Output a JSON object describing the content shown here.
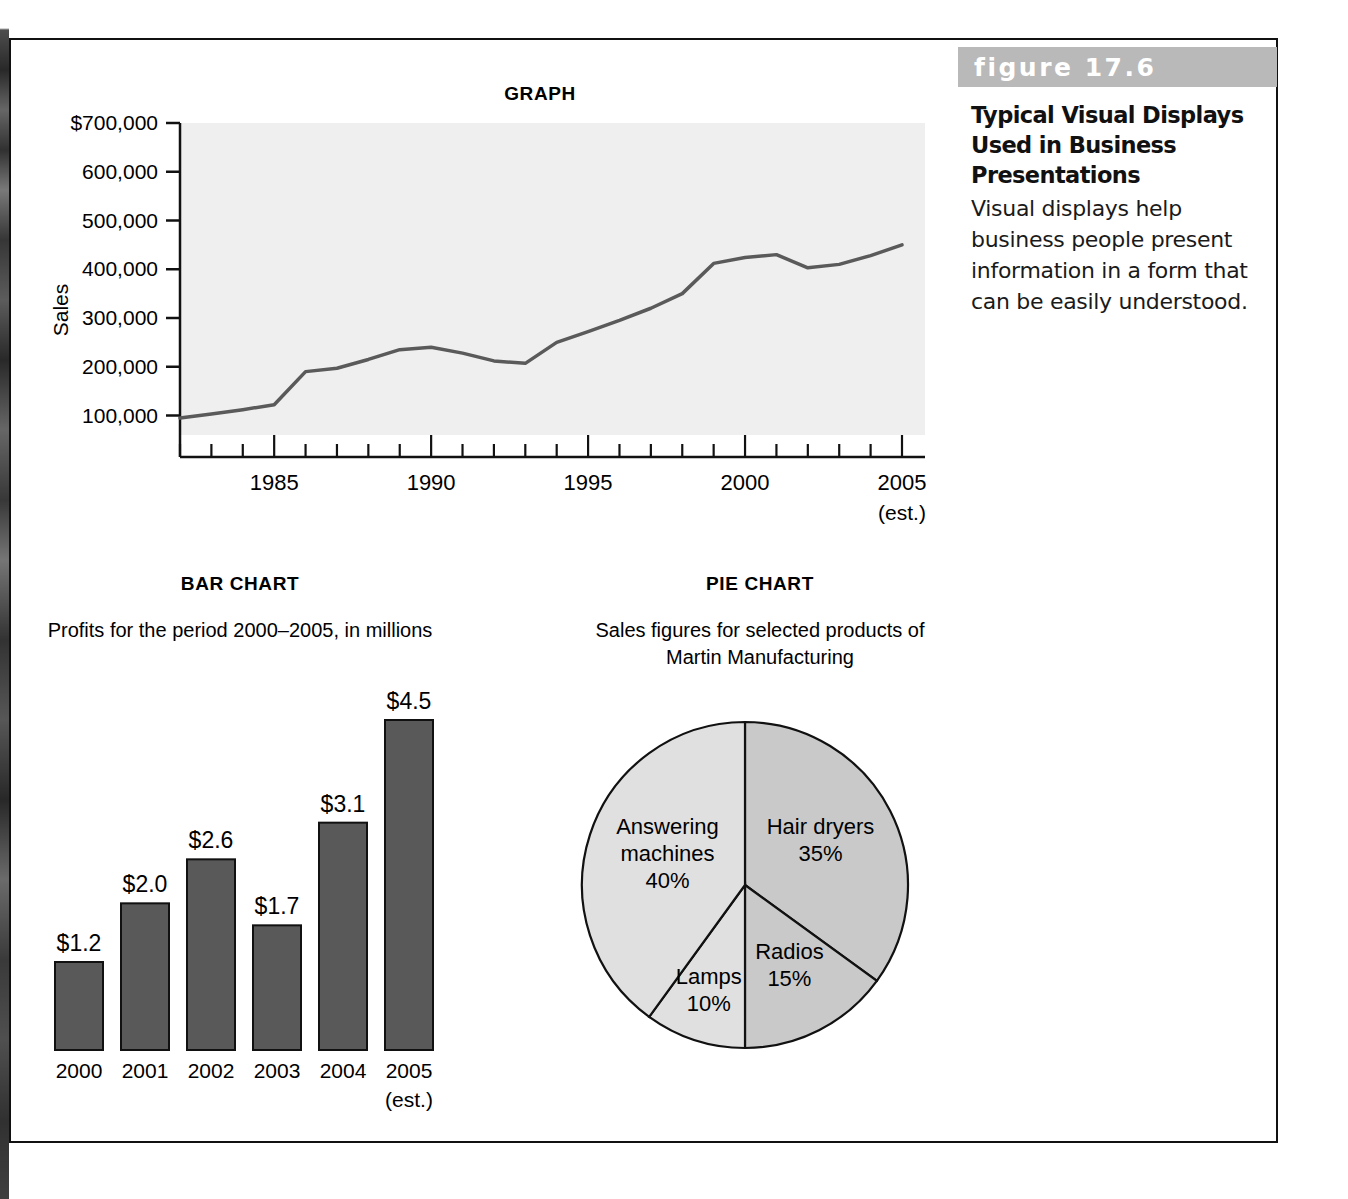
{
  "figure": {
    "number_label": "figure 17.6",
    "title": "Typical Visual Displays Used in Business Presentations",
    "description": "Visual displays help business people present information in a form that can be easily understood.",
    "header_bg": "#b9b9b9"
  },
  "colors": {
    "plot_background": "#efefef",
    "line_color": "#5a5a5a",
    "bar_fill": "#595959",
    "bar_stroke": "#111111",
    "pie_light": "#e0e0e0",
    "pie_dark": "#c9c9c9",
    "axis": "#111111"
  },
  "chart_data": [
    {
      "type": "line",
      "title": "GRAPH",
      "xlabel": "",
      "ylabel": "Sales",
      "ylim": [
        60000,
        700000
      ],
      "xlim": [
        1982,
        2005
      ],
      "grid": false,
      "y_ticks": [
        "$700,000",
        "600,000",
        "500,000",
        "400,000",
        "300,000",
        "200,000",
        "100,000"
      ],
      "y_tick_values": [
        700000,
        600000,
        500000,
        400000,
        300000,
        200000,
        100000
      ],
      "x_ticks": [
        "1985",
        "1990",
        "1995",
        "2000",
        "2005"
      ],
      "x_tick_values": [
        1985,
        1990,
        1995,
        2000,
        2005
      ],
      "x_tick_note": "(est.)",
      "x": [
        1982,
        1983,
        1984,
        1985,
        1986,
        1987,
        1988,
        1989,
        1990,
        1991,
        1992,
        1993,
        1994,
        1995,
        1996,
        1997,
        1998,
        1999,
        2000,
        2001,
        2002,
        2003,
        2004,
        2005
      ],
      "values": [
        95000,
        103000,
        112000,
        122000,
        190000,
        197000,
        215000,
        235000,
        240000,
        228000,
        212000,
        207000,
        250000,
        272000,
        295000,
        320000,
        350000,
        412000,
        424000,
        430000,
        403000,
        410000,
        428000,
        450000
      ]
    },
    {
      "type": "bar",
      "title": "BAR CHART",
      "subtitle": "Profits for the period 2000–2005, in millions",
      "xlabel": "",
      "ylabel": "",
      "ylim": [
        0,
        4.5
      ],
      "categories": [
        "2000",
        "2001",
        "2002",
        "2003",
        "2004",
        "2005"
      ],
      "category_note": "(est.)",
      "values": [
        1.2,
        2.0,
        2.6,
        1.7,
        3.1,
        4.5
      ],
      "data_labels": [
        "$1.2",
        "$2.0",
        "$2.6",
        "$1.7",
        "$3.1",
        "$4.5"
      ]
    },
    {
      "type": "pie",
      "title": "PIE CHART",
      "subtitle": "Sales figures for selected products of Martin Manufacturing",
      "labels": [
        "Hair dryers",
        "Radios",
        "Lamps",
        "Answering machines"
      ],
      "values": [
        35,
        15,
        10,
        40
      ],
      "value_labels": [
        "35%",
        "15%",
        "10%",
        "40%"
      ]
    }
  ]
}
